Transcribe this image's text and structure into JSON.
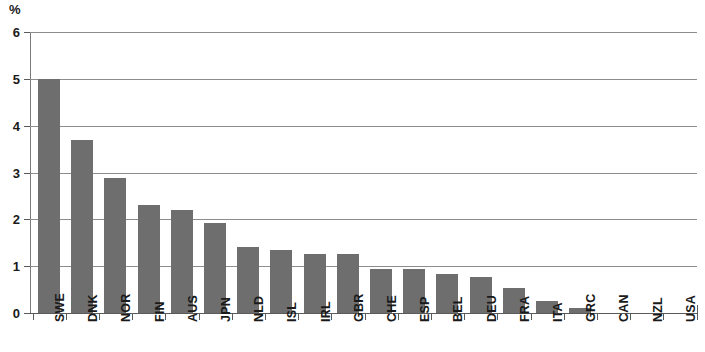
{
  "chart_data": {
    "type": "bar",
    "title": "",
    "subtitle": "",
    "xlabel": "",
    "ylabel": "",
    "unit_label": "%",
    "ylim": [
      0,
      6
    ],
    "ytick_labels": [
      "0",
      "1",
      "2",
      "3",
      "4",
      "5",
      "6"
    ],
    "ytick_values": [
      0,
      1,
      2,
      3,
      4,
      5,
      6
    ],
    "grid": "horizontal",
    "legend": "none",
    "bar_color": "#6e6e6e",
    "gridline_color": "#8d8d8d",
    "axis_color": "#5a5a5a",
    "categories": [
      "SWE",
      "DNK",
      "NOR",
      "FIN",
      "AUS",
      "JPN",
      "NLD",
      "ISL",
      "IRL",
      "GBR",
      "CHE",
      "ESP",
      "BEL",
      "DEU",
      "FRA",
      "ITA",
      "GRC",
      "CAN",
      "NZL",
      "USA"
    ],
    "values": [
      5.0,
      3.7,
      2.88,
      2.3,
      2.21,
      1.93,
      1.42,
      1.34,
      1.25,
      1.25,
      0.93,
      0.93,
      0.83,
      0.76,
      0.53,
      0.25,
      0.11,
      0.0,
      0.0,
      0.0
    ]
  }
}
